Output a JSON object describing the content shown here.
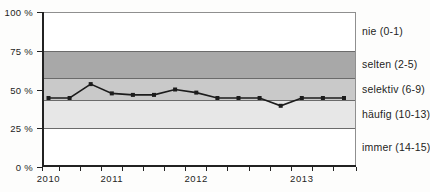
{
  "chart_data": {
    "type": "line",
    "title": "",
    "xlabel": "",
    "ylabel": "",
    "ylim": [
      0,
      100
    ],
    "grid": "band-boundaries-only",
    "legend": "right-side-band-labels",
    "y_ticks": [
      {
        "label": "0 %",
        "value": 0
      },
      {
        "label": "25 %",
        "value": 25
      },
      {
        "label": "50 %",
        "value": 50
      },
      {
        "label": "75 %",
        "value": 75
      },
      {
        "label": "100 %",
        "value": 100
      }
    ],
    "x": {
      "n_points": 15,
      "tick_style": "between-points-and-edges",
      "years": [
        {
          "label": "2010",
          "point_index": 0
        },
        {
          "label": "2011",
          "point_index": 3
        },
        {
          "label": "2012",
          "point_index": 7
        },
        {
          "label": "2013",
          "point_index": 12
        }
      ]
    },
    "series": [
      {
        "name": "anteil-selektiv-linie",
        "values": [
          44.5,
          44.5,
          53.5,
          47.5,
          46.5,
          46.5,
          50,
          48,
          44.5,
          44.5,
          44.5,
          39.5,
          44.5,
          44.5,
          44.5
        ],
        "color": "#1c1c1c",
        "marker": "square"
      }
    ],
    "bands": [
      {
        "label": "nie (0-1)",
        "from": 75,
        "to": 100,
        "color": "#ffffff"
      },
      {
        "label": "selten (2-5)",
        "from": 57.5,
        "to": 75,
        "color": "#a8a8a8"
      },
      {
        "label": "selektiv (6-9)",
        "from": 43,
        "to": 57.5,
        "color": "#c9c9c9"
      },
      {
        "label": "häufig (10-13)",
        "from": 25,
        "to": 43,
        "color": "#e7e7e7"
      },
      {
        "label": "immer (14-15)",
        "from": 0,
        "to": 25,
        "color": "#ffffff"
      }
    ],
    "band_boundary_color": "#6b6b6b"
  }
}
